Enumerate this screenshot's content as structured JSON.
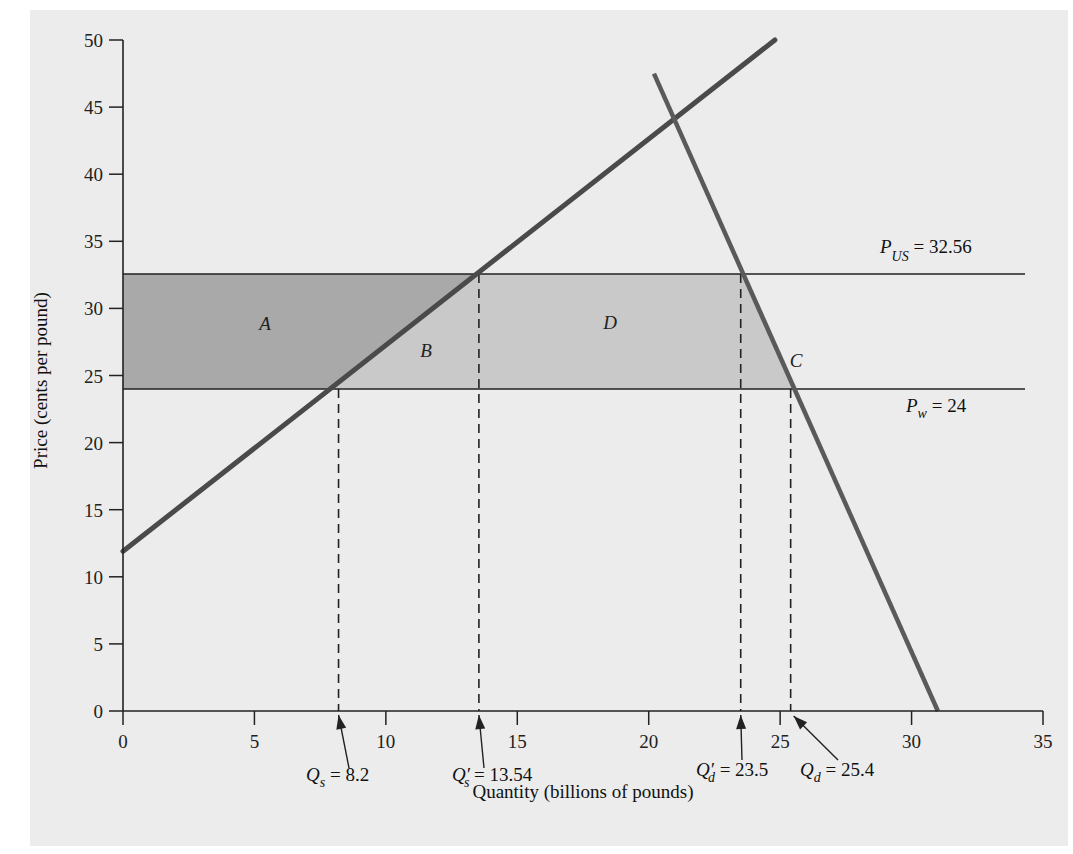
{
  "chart_data": {
    "type": "line",
    "title": "",
    "xlabel": "Quantity (billions of pounds)",
    "ylabel": "Price (cents per pound)",
    "xlim": [
      0,
      35
    ],
    "ylim": [
      0,
      50
    ],
    "x_ticks": [
      0,
      5,
      10,
      15,
      20,
      25,
      30,
      35
    ],
    "y_ticks": [
      0,
      5,
      10,
      15,
      20,
      25,
      30,
      35,
      40,
      45,
      50
    ],
    "grid": false,
    "series": [
      {
        "name": "Supply",
        "points": [
          [
            0,
            11.9
          ],
          [
            24.8,
            50
          ]
        ]
      },
      {
        "name": "Demand",
        "points": [
          [
            20.2,
            47.5
          ],
          [
            31.0,
            0
          ]
        ]
      }
    ],
    "price_lines": [
      {
        "name": "P_US",
        "value": 32.56,
        "label_main": "P",
        "label_sub": "US",
        "label_rest": " = 32.56"
      },
      {
        "name": "P_w",
        "value": 24,
        "label_main": "P",
        "label_sub": "w",
        "label_rest": " =  24"
      }
    ],
    "quantity_markers": [
      {
        "name": "Q_s",
        "value": 8.2,
        "label_main": "Q",
        "label_prime": "",
        "label_sub": "s",
        "label_rest": " = 8.2"
      },
      {
        "name": "Q_s_prime",
        "value": 13.54,
        "label_main": "Q",
        "label_prime": "′",
        "label_sub": "s",
        "label_rest": " = 13.54"
      },
      {
        "name": "Q_d_prime",
        "value": 23.5,
        "label_main": "Q",
        "label_prime": "′",
        "label_sub": "d",
        "label_rest": " = 23.5"
      },
      {
        "name": "Q_d",
        "value": 25.4,
        "label_main": "Q",
        "label_prime": "",
        "label_sub": "d",
        "label_rest": " = 25.4"
      }
    ],
    "regions": [
      {
        "label": "A",
        "description": "Producer surplus gain: between P_w and P_US, left of supply curve",
        "shade": "dark"
      },
      {
        "label": "B",
        "description": "Triangle between supply curve, P_w, P_US and Q_s'",
        "shade": "light"
      },
      {
        "label": "D",
        "description": "Rectangle between P_w and P_US from Q_s' to Q_d'",
        "shade": "light"
      },
      {
        "label": "C",
        "description": "Triangle between Q_d', demand curve, P_w and P_US",
        "shade": "light"
      }
    ],
    "colors": {
      "panel": "#ececec",
      "region_dark": "#a9a9a9",
      "region_light": "#c9c9c9",
      "curves": "#505050",
      "axes": "#222222"
    }
  }
}
